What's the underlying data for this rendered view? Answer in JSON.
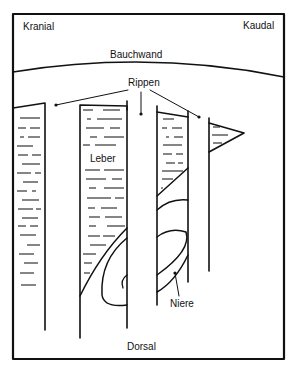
{
  "diagram": {
    "labels": {
      "cranial": "Kranial",
      "caudal": "Kaudal",
      "abdominal_wall": "Bauchwand",
      "ribs": "Rippen",
      "liver": "Leber",
      "kidney": "Niere",
      "dorsal": "Dorsal"
    },
    "colors": {
      "line": "#111111",
      "background": "#ffffff"
    }
  }
}
